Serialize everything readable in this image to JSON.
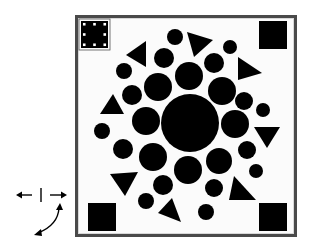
{
  "diagram": {
    "type": "rotation-puzzle-figure",
    "colors": {
      "shape": "#000000",
      "frame": "#4a4a4a",
      "background": "#ffffff",
      "marker_dots": "#ffffff"
    },
    "frame": {
      "x": 75,
      "y": 15,
      "size": 222
    },
    "corner_squares": [
      {
        "id": "top-left",
        "x": 81,
        "y": 21,
        "size": 27,
        "marked": true
      },
      {
        "id": "top-right",
        "x": 259,
        "y": 21,
        "size": 28,
        "marked": false
      },
      {
        "id": "bottom-left",
        "x": 88,
        "y": 203,
        "size": 28,
        "marked": false
      },
      {
        "id": "bottom-right",
        "x": 259,
        "y": 203,
        "size": 28,
        "marked": false
      }
    ],
    "circles": [
      {
        "cx": 190,
        "cy": 123,
        "r": 29
      },
      {
        "cx": 189,
        "cy": 76,
        "r": 14
      },
      {
        "cx": 158,
        "cy": 87,
        "r": 14
      },
      {
        "cx": 222,
        "cy": 91,
        "r": 14
      },
      {
        "cx": 146,
        "cy": 121,
        "r": 14
      },
      {
        "cx": 235,
        "cy": 124,
        "r": 14
      },
      {
        "cx": 153,
        "cy": 157,
        "r": 14
      },
      {
        "cx": 219,
        "cy": 161,
        "r": 13
      },
      {
        "cx": 188,
        "cy": 170,
        "r": 14
      },
      {
        "cx": 175,
        "cy": 37,
        "r": 8
      },
      {
        "cx": 230,
        "cy": 47,
        "r": 7
      },
      {
        "cx": 164,
        "cy": 58,
        "r": 10
      },
      {
        "cx": 214,
        "cy": 63,
        "r": 10
      },
      {
        "cx": 124,
        "cy": 71,
        "r": 8
      },
      {
        "cx": 132,
        "cy": 95,
        "r": 10
      },
      {
        "cx": 244,
        "cy": 101,
        "r": 9
      },
      {
        "cx": 263,
        "cy": 110,
        "r": 7
      },
      {
        "cx": 102,
        "cy": 131,
        "r": 8
      },
      {
        "cx": 123,
        "cy": 149,
        "r": 10
      },
      {
        "cx": 247,
        "cy": 150,
        "r": 9
      },
      {
        "cx": 256,
        "cy": 171,
        "r": 7
      },
      {
        "cx": 163,
        "cy": 185,
        "r": 10
      },
      {
        "cx": 214,
        "cy": 188,
        "r": 9
      },
      {
        "cx": 146,
        "cy": 201,
        "r": 8
      },
      {
        "cx": 206,
        "cy": 212,
        "r": 8
      }
    ],
    "triangles": [
      {
        "points": "126,55 146,41 146,67"
      },
      {
        "points": "187,32 213,40 194,57"
      },
      {
        "points": "238,57 262,73 238,80"
      },
      {
        "points": "113,94 124,114 100,114"
      },
      {
        "points": "254,127 280,127 267,148"
      },
      {
        "points": "110,174 138,172 125,196"
      },
      {
        "points": "234,176 256,200 229,200"
      },
      {
        "points": "172,198 181,222 158,213"
      }
    ],
    "legend_arrows": {
      "horizontal_flip": {
        "glyph": "←|→",
        "x": 38,
        "y": 195
      },
      "rotation_arrow": {
        "glyph": "curved double-headed arrow",
        "x": 52,
        "y": 215
      }
    }
  }
}
